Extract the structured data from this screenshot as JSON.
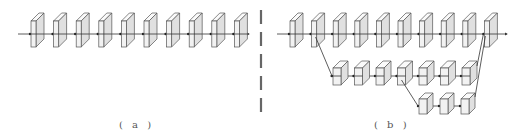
{
  "panels": {
    "a": {
      "label": "( a )",
      "description": "plain sequential network",
      "top_row_count": 10
    },
    "b": {
      "label": "( b )",
      "description": "multi-branch network with two side branches",
      "top_row_count": 10,
      "mid_row_count": 7,
      "bottom_row_count": 3
    }
  },
  "colors": {
    "stroke": "#555555",
    "face": "#f2f2f2",
    "side": "#e0e0e0",
    "top": "#fafafa",
    "separator": "#666666"
  }
}
